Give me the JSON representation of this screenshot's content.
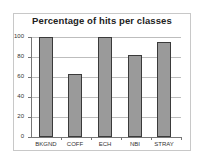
{
  "chart_data": {
    "type": "bar",
    "title": "Percentage of hits per classes",
    "categories": [
      "BKGND",
      "COFF",
      "ECH",
      "NBI",
      "STRAY"
    ],
    "values": [
      100,
      63,
      100,
      82,
      95
    ],
    "xlabel": "",
    "ylabel": "",
    "ylim": [
      0,
      100
    ],
    "yticks": [
      "0",
      "20",
      "40",
      "60",
      "80",
      "100"
    ],
    "grid": true,
    "legend": "none",
    "colors": {
      "bar_fill": "#9a9a9a",
      "bar_border": "#3a3a3a",
      "grid": "#bdbdbd"
    }
  }
}
